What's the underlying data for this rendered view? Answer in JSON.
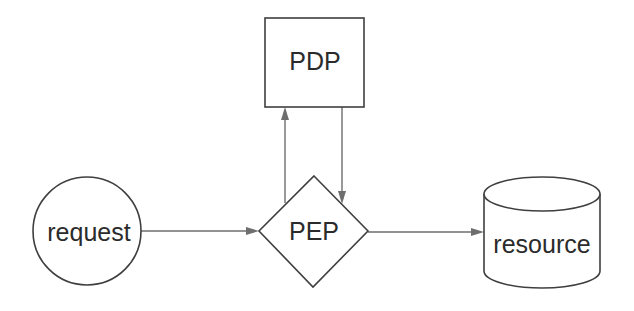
{
  "diagram": {
    "nodes": [
      {
        "id": "request",
        "label": "request",
        "shape": "circle"
      },
      {
        "id": "pep",
        "label": "PEP",
        "shape": "diamond"
      },
      {
        "id": "pdp",
        "label": "PDP",
        "shape": "rectangle"
      },
      {
        "id": "resource",
        "label": "resource",
        "shape": "cylinder"
      }
    ],
    "edges": [
      {
        "from": "request",
        "to": "pep"
      },
      {
        "from": "pep",
        "to": "pdp"
      },
      {
        "from": "pdp",
        "to": "pep"
      },
      {
        "from": "pep",
        "to": "resource"
      }
    ],
    "colors": {
      "shape_stroke": "#3f3f3f",
      "connector": "#6e6e6e",
      "text": "#2b2b2b",
      "background": "#ffffff"
    }
  }
}
